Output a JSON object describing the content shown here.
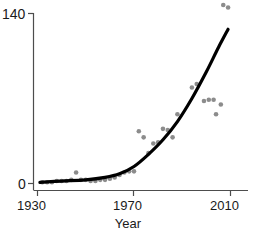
{
  "chart_data": {
    "type": "scatter",
    "title": "",
    "subtitle": "",
    "xlabel": "Year",
    "ylabel": "",
    "xlim": [
      1930,
      2010
    ],
    "ylim": [
      0,
      140
    ],
    "grid": false,
    "legend": null,
    "axis": {
      "y_ticks": [
        {
          "value": 140,
          "label": "140"
        },
        {
          "value": 0,
          "label": "0"
        }
      ],
      "x_ticks": [
        {
          "value": 1930,
          "label": "1930"
        },
        {
          "value": 1970,
          "label": "1970"
        },
        {
          "value": 2010,
          "label": "2010"
        }
      ]
    },
    "series": [
      {
        "name": "observations",
        "type": "scatter",
        "marker": "circle",
        "color": "#8c8c8c",
        "points": [
          {
            "x": 1932,
            "y": 1
          },
          {
            "x": 1934,
            "y": 1
          },
          {
            "x": 1936,
            "y": 1
          },
          {
            "x": 1938,
            "y": 2
          },
          {
            "x": 1940,
            "y": 2
          },
          {
            "x": 1942,
            "y": 2
          },
          {
            "x": 1944,
            "y": 3
          },
          {
            "x": 1946,
            "y": 9
          },
          {
            "x": 1948,
            "y": 3
          },
          {
            "x": 1950,
            "y": 3
          },
          {
            "x": 1952,
            "y": 2
          },
          {
            "x": 1954,
            "y": 2
          },
          {
            "x": 1956,
            "y": 3
          },
          {
            "x": 1958,
            "y": 3
          },
          {
            "x": 1960,
            "y": 4
          },
          {
            "x": 1962,
            "y": 5
          },
          {
            "x": 1964,
            "y": 7
          },
          {
            "x": 1966,
            "y": 9
          },
          {
            "x": 1968,
            "y": 10
          },
          {
            "x": 1970,
            "y": 10
          },
          {
            "x": 1972,
            "y": 43
          },
          {
            "x": 1974,
            "y": 38
          },
          {
            "x": 1976,
            "y": 25
          },
          {
            "x": 1978,
            "y": 33
          },
          {
            "x": 1980,
            "y": 34
          },
          {
            "x": 1982,
            "y": 45
          },
          {
            "x": 1984,
            "y": 44
          },
          {
            "x": 1986,
            "y": 38
          },
          {
            "x": 1988,
            "y": 57
          },
          {
            "x": 1994,
            "y": 79
          },
          {
            "x": 1996,
            "y": 82
          },
          {
            "x": 1999,
            "y": 68
          },
          {
            "x": 2001,
            "y": 69
          },
          {
            "x": 2003,
            "y": 69
          },
          {
            "x": 2004,
            "y": 57
          },
          {
            "x": 2006,
            "y": 65
          },
          {
            "x": 2007,
            "y": 147
          },
          {
            "x": 2009,
            "y": 145
          }
        ]
      },
      {
        "name": "fitted-trend",
        "type": "line",
        "color": "#000000",
        "points": [
          {
            "x": 1931,
            "y": 1
          },
          {
            "x": 1940,
            "y": 2
          },
          {
            "x": 1950,
            "y": 3
          },
          {
            "x": 1958,
            "y": 5
          },
          {
            "x": 1964,
            "y": 8
          },
          {
            "x": 1970,
            "y": 14
          },
          {
            "x": 1976,
            "y": 24
          },
          {
            "x": 1982,
            "y": 36
          },
          {
            "x": 1988,
            "y": 51
          },
          {
            "x": 1994,
            "y": 70
          },
          {
            "x": 2000,
            "y": 92
          },
          {
            "x": 2005,
            "y": 112
          },
          {
            "x": 2009,
            "y": 127
          }
        ]
      }
    ]
  },
  "labels": {
    "y_top": "140",
    "y_bottom": "0",
    "x_left": "1930",
    "x_mid": "1970",
    "x_right": "2010",
    "axis_title": "Year"
  },
  "colors": {
    "point": "#8c8c8c",
    "curve": "#000000",
    "axis": "#4d4d4d",
    "text": "#1a1a1a",
    "background": "#ffffff"
  }
}
